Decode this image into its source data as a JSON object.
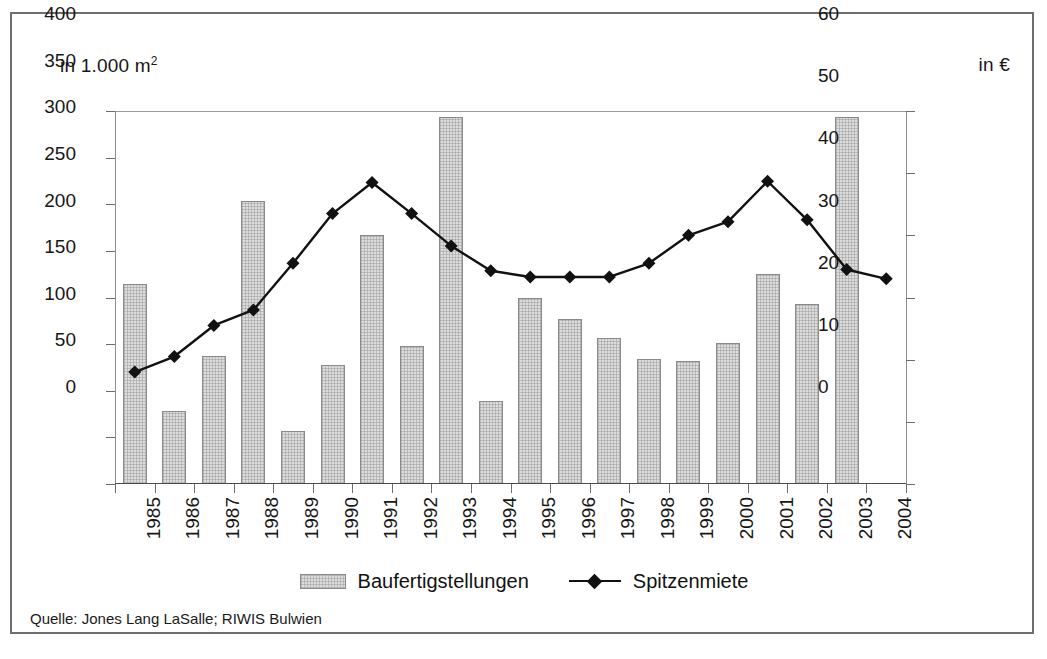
{
  "frame": {
    "left_axis_caption_main": "in 1.000 m",
    "left_axis_caption_sup": "2",
    "right_axis_caption": "in €"
  },
  "legend": {
    "bars_label": "Baufertigstellungen",
    "line_label": "Spitzenmiete"
  },
  "source": "Quelle: Jones Lang LaSalle; RIWIS Bulwien",
  "colors": {
    "bar_fill": "#dcdcdc",
    "bar_border": "#8a8a8a",
    "line": "#111111",
    "marker": "#111111",
    "frame_border": "#6e6e6e",
    "axis": "#6d6d6d",
    "text": "#161616"
  },
  "chart_data": {
    "type": "bar",
    "title": "",
    "subtitle": "",
    "xlabel": "",
    "ylabel": "in 1.000 m2",
    "y2label": "in €",
    "grid": false,
    "legend_position": "bottom",
    "ylim": [
      0,
      400
    ],
    "y2lim": [
      0,
      60
    ],
    "yticks": [
      0,
      50,
      100,
      150,
      200,
      250,
      300,
      350,
      400
    ],
    "y2ticks": [
      0,
      10,
      20,
      30,
      40,
      50,
      60
    ],
    "categories": [
      "1985",
      "1986",
      "1987",
      "1988",
      "1989",
      "1990",
      "1991",
      "1992",
      "1993",
      "1994",
      "1995",
      "1996",
      "1997",
      "1998",
      "1999",
      "2000",
      "2001",
      "2002",
      "2003",
      "2004"
    ],
    "series": [
      {
        "name": "Baufertigstellungen",
        "type": "bar",
        "axis": "left",
        "unit": "1.000 m2",
        "values": [
          214,
          78,
          137,
          303,
          57,
          128,
          267,
          148,
          394,
          89,
          200,
          177,
          157,
          134,
          132,
          151,
          225,
          193,
          394,
          null
        ]
      },
      {
        "name": "Spitzenmiete",
        "type": "line",
        "axis": "right",
        "unit": "€",
        "values": [
          18.0,
          20.5,
          25.5,
          28.0,
          35.5,
          43.5,
          48.5,
          43.5,
          38.3,
          34.3,
          33.3,
          33.3,
          33.3,
          35.5,
          40.0,
          42.2,
          48.7,
          42.5,
          34.5,
          33.0
        ]
      }
    ]
  }
}
